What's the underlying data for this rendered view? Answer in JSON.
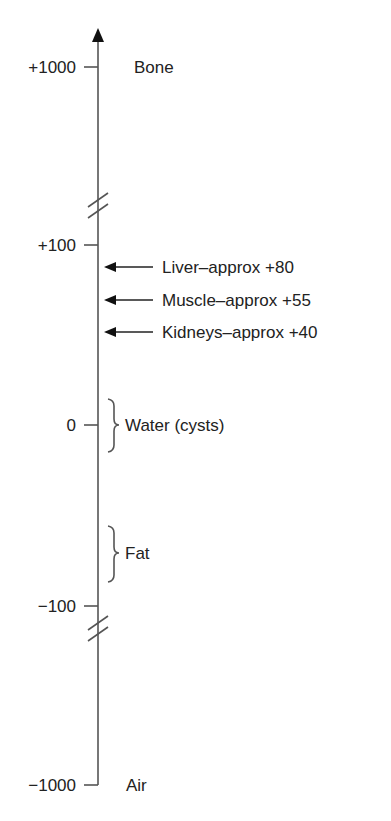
{
  "diagram": {
    "title": "",
    "scale_name": "Hounsfield units",
    "ticks": [
      {
        "value": "+1000",
        "label": "Bone"
      },
      {
        "value": "+100",
        "label": ""
      },
      {
        "value": "0",
        "label": ""
      },
      {
        "value": "−100",
        "label": ""
      },
      {
        "value": "−1000",
        "label": "Air"
      }
    ],
    "arrows": [
      {
        "label": "Liver–approx +80",
        "value": 80
      },
      {
        "label": "Muscle–approx +55",
        "value": 55
      },
      {
        "label": "Kidneys–approx +40",
        "value": 40
      }
    ],
    "ranges": [
      {
        "label": "Water (cysts)",
        "center": 0
      },
      {
        "label": "Fat",
        "center": -75
      }
    ],
    "axis_breaks": [
      "between +1000 and +100",
      "between −100 and −1000"
    ]
  }
}
